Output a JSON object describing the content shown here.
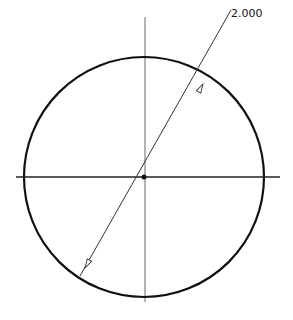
{
  "drawing": {
    "title": "Circle diameter dimension",
    "dimension": {
      "type": "diameter",
      "value_label": "2.000"
    },
    "circle": {
      "cx": 144,
      "cy": 177,
      "r": 120
    },
    "centerlines": {
      "horizontal": {
        "x1": 16,
        "x2": 280,
        "y": 177
      },
      "vertical": {
        "x": 145,
        "y1": 17,
        "y2": 302
      }
    },
    "leader": {
      "x1": 231,
      "y1": 10,
      "x2": 80,
      "y2": 276
    },
    "colors": {
      "stroke": "#111111",
      "centerline": "#555555",
      "background": "#ffffff"
    }
  }
}
